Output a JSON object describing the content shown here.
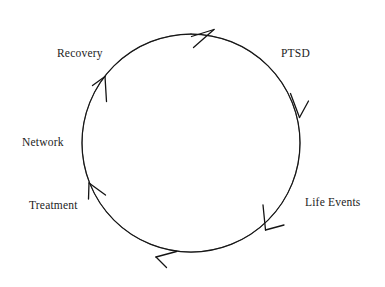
{
  "diagram": {
    "type": "cycle",
    "direction": "clockwise",
    "title": "",
    "stroke_color": "#1a1a1a",
    "background_color": "#ffffff",
    "text_color": "#1c1c1c",
    "circle": {
      "center_x": 191,
      "center_y": 143,
      "radius": 109
    },
    "nodes": [
      {
        "id": "ptsd",
        "label": "PTSD",
        "angle_deg": 315
      },
      {
        "id": "life",
        "label": "Life Events",
        "angle_deg": 25
      },
      {
        "id": "treatment",
        "label": "Treatment",
        "angle_deg": 155
      },
      {
        "id": "network",
        "label": "Network",
        "angle_deg": 180
      },
      {
        "id": "recovery",
        "label": "Recovery",
        "angle_deg": 225
      }
    ],
    "arrowheads": [
      {
        "id": "arrow-top",
        "angle_deg": 283,
        "points": "clockwise"
      },
      {
        "id": "arrow-upper-right",
        "angle_deg": 330,
        "points": "clockwise"
      },
      {
        "id": "arrow-lower-right",
        "angle_deg": 35,
        "points": "clockwise"
      },
      {
        "id": "arrow-bottom",
        "angle_deg": 100,
        "points": "clockwise"
      },
      {
        "id": "arrow-lower-left",
        "angle_deg": 150,
        "points": "clockwise"
      },
      {
        "id": "arrow-upper-left",
        "angle_deg": 208,
        "points": "clockwise"
      }
    ]
  }
}
